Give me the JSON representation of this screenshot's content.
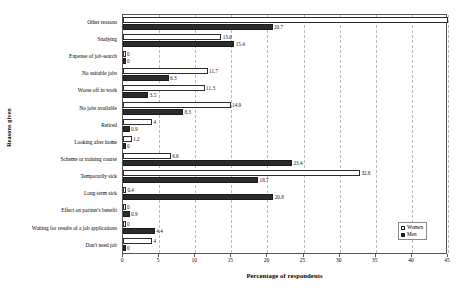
{
  "chart_data": {
    "type": "bar",
    "orientation": "horizontal",
    "title": "",
    "xlabel": "Percentage of respondents",
    "ylabel": "Reasons given",
    "xlim": [
      0,
      45
    ],
    "xticks": [
      0,
      5,
      10,
      15,
      20,
      25,
      30,
      35,
      40,
      45
    ],
    "grid": true,
    "legend_position": "bottom-right",
    "categories": [
      "Other reasons",
      "Studying",
      "Expense of job-search",
      "No suitable jobs",
      "Worse off in work",
      "No jobs available",
      "Retired",
      "Looking after home",
      "Scheme or training course",
      "Temporarily sick",
      "Long-term sick",
      "Effect on partner's benefit",
      "Waiting for results of a job applications",
      "Don't need job"
    ],
    "series": [
      {
        "name": "Women",
        "color": "#ffffff",
        "values": [
          45,
          13.6,
          0,
          11.7,
          11.3,
          14.9,
          4,
          1.2,
          6.6,
          32.8,
          0.4,
          0,
          0,
          4
        ],
        "labels": [
          "",
          "13.6",
          "0",
          "11.7",
          "11.3",
          "14.9",
          "4",
          "1.2",
          "6.6",
          "32.8",
          "0.4",
          "0",
          "0",
          "4"
        ]
      },
      {
        "name": "Men",
        "color": "#2b2b2b",
        "values": [
          20.7,
          15.4,
          0,
          6.3,
          3.5,
          8.3,
          0.9,
          0,
          23.4,
          18.7,
          20.8,
          0.9,
          4.4,
          0
        ],
        "labels": [
          "20.7",
          "15.4",
          "0",
          "6.3",
          "3.5",
          "8.3",
          "0.9",
          "0",
          "23.4",
          "18.7",
          "20.8",
          "0.9",
          "4.4",
          "0"
        ]
      }
    ]
  },
  "legend": {
    "items": [
      {
        "label": "Women"
      },
      {
        "label": "Men"
      }
    ]
  }
}
